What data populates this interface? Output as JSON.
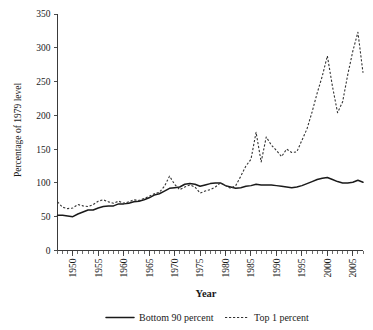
{
  "chart_data": {
    "type": "line",
    "title": "",
    "xlabel": "Year",
    "ylabel": "Percentage of 1979 level",
    "xlim": [
      1947,
      2007
    ],
    "ylim": [
      0,
      350
    ],
    "grid": false,
    "legend_position": "bottom",
    "y_ticks": [
      0,
      50,
      100,
      150,
      200,
      250,
      300,
      350
    ],
    "y_tick_labels": [
      "0",
      "50",
      "100",
      "150",
      "200",
      "250",
      "300",
      "350"
    ],
    "x_ticks": [
      1950,
      1955,
      1960,
      1965,
      1970,
      1975,
      1980,
      1985,
      1990,
      1995,
      2000,
      2005
    ],
    "x_tick_labels": [
      "1950",
      "1955",
      "1960",
      "1965",
      "1970",
      "1975",
      "1980",
      "1985",
      "1990",
      "1995",
      "2000",
      "2005"
    ],
    "x_minor_tick_interval": 1,
    "x": [
      1947,
      1948,
      1949,
      1950,
      1951,
      1952,
      1953,
      1954,
      1955,
      1956,
      1957,
      1958,
      1959,
      1960,
      1961,
      1962,
      1963,
      1964,
      1965,
      1966,
      1967,
      1968,
      1969,
      1970,
      1971,
      1972,
      1973,
      1974,
      1975,
      1976,
      1977,
      1978,
      1979,
      1980,
      1981,
      1982,
      1983,
      1984,
      1985,
      1986,
      1987,
      1988,
      1989,
      1990,
      1991,
      1992,
      1993,
      1994,
      1995,
      1996,
      1997,
      1998,
      1999,
      2000,
      2001,
      2002,
      2003,
      2004,
      2005,
      2006,
      2007
    ],
    "series": [
      {
        "name": "Bottom 90 percent",
        "style": "solid",
        "color": "#1a1a1a",
        "values": [
          52,
          52,
          51,
          50,
          54,
          57,
          60,
          60,
          63,
          65,
          66,
          66,
          69,
          69,
          70,
          72,
          73,
          75,
          78,
          82,
          84,
          88,
          92,
          93,
          94,
          98,
          99,
          98,
          95,
          97,
          99,
          100,
          100,
          96,
          94,
          92,
          93,
          95,
          96,
          98,
          97,
          97,
          97,
          96,
          95,
          94,
          93,
          94,
          96,
          99,
          102,
          105,
          107,
          108,
          105,
          102,
          100,
          100,
          101,
          104,
          101
        ]
      },
      {
        "name": "Top 1 percent",
        "style": "dashed",
        "color": "#333333",
        "values": [
          72,
          64,
          62,
          63,
          68,
          66,
          65,
          68,
          73,
          75,
          72,
          70,
          73,
          70,
          72,
          75,
          74,
          77,
          80,
          84,
          86,
          95,
          110,
          98,
          90,
          94,
          97,
          94,
          85,
          88,
          90,
          94,
          100,
          96,
          92,
          96,
          110,
          125,
          135,
          175,
          131,
          168,
          156,
          148,
          139,
          150,
          145,
          146,
          163,
          180,
          205,
          233,
          258,
          288,
          243,
          204,
          220,
          260,
          295,
          323,
          263
        ]
      }
    ],
    "annotations": []
  },
  "legend": {
    "items": [
      {
        "label": "Bottom 90 percent",
        "style": "solid"
      },
      {
        "label": "Top 1 percent",
        "style": "dashed"
      }
    ]
  }
}
